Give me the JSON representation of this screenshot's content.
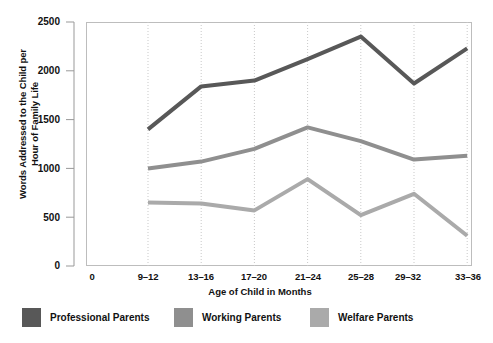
{
  "chart_data": {
    "type": "line",
    "title": "",
    "xlabel": "Age of Child in Months",
    "ylabel_line1": "Words Addressed to the Child per",
    "ylabel_line2": "Hour of Family Life",
    "categories": [
      "9–12",
      "13–16",
      "17–20",
      "21–24",
      "25–28",
      "29–32",
      "33–36"
    ],
    "ylim": [
      0,
      2500
    ],
    "yticks": [
      0,
      500,
      1000,
      1500,
      2000,
      2500
    ],
    "ytick_labels": [
      "0",
      "500",
      "1000",
      "1500",
      "2000",
      "2500"
    ],
    "x_origin_label": "0",
    "grid": "vertical-dotted",
    "legend_position": "below-axis",
    "series": [
      {
        "name": "Professional Parents",
        "color": "#585858",
        "values": [
          1400,
          1840,
          1900,
          2120,
          2350,
          1870,
          2230
        ]
      },
      {
        "name": "Working Parents",
        "color": "#8f8f8f",
        "values": [
          1000,
          1070,
          1200,
          1420,
          1280,
          1090,
          1130
        ]
      },
      {
        "name": "Welfare Parents",
        "color": "#aaaaaa",
        "values": [
          650,
          640,
          570,
          890,
          520,
          740,
          310
        ]
      }
    ]
  },
  "axes": {
    "plot_border_color": "#b8b8b8",
    "gridline_color": "#c9c9c9",
    "axis_color": "#999999",
    "background": "#ffffff"
  }
}
